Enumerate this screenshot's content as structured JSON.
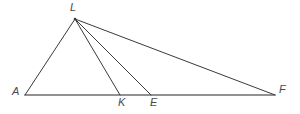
{
  "figure": {
    "type": "geometry-diagram",
    "width": 300,
    "height": 114,
    "background_color": "#ffffff"
  },
  "style": {
    "baseline_color": "#6f6f6f",
    "baseline_width": 1.6,
    "cevian_color": "#3a3a3a",
    "cevian_width": 1.0,
    "label_color": "#4a4a4a",
    "label_font_size": 11
  },
  "points": {
    "L": {
      "label": "L",
      "x": 75,
      "y": 19
    },
    "A": {
      "label": "A",
      "x": 25,
      "y": 95
    },
    "K": {
      "label": "K",
      "x": 120,
      "y": 95
    },
    "E": {
      "label": "E",
      "x": 151,
      "y": 95
    },
    "F": {
      "label": "F",
      "x": 275,
      "y": 95
    }
  },
  "segments": [
    {
      "name": "base-AF",
      "from": "A",
      "to": "F",
      "kind": "baseline"
    },
    {
      "name": "side-LA",
      "from": "L",
      "to": "A",
      "kind": "cevian"
    },
    {
      "name": "cevian-LK",
      "from": "L",
      "to": "K",
      "kind": "cevian"
    },
    {
      "name": "cevian-LE",
      "from": "L",
      "to": "E",
      "kind": "cevian"
    },
    {
      "name": "side-LF",
      "from": "L",
      "to": "F",
      "kind": "cevian"
    }
  ]
}
